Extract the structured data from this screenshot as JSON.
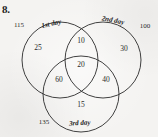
{
  "problem": {
    "number": "8."
  },
  "diagram": {
    "type": "venn-3-circle",
    "circles": [
      {
        "id": "first-day",
        "label": "1st day",
        "outside_total": "115"
      },
      {
        "id": "second-day",
        "label": "2nd day",
        "outside_total": "100"
      },
      {
        "id": "third-day",
        "label": "3rd day",
        "outside_total": "135"
      }
    ],
    "regions": [
      {
        "id": "first-only",
        "value": "25"
      },
      {
        "id": "first-second",
        "value": "10"
      },
      {
        "id": "second-only",
        "value": "30"
      },
      {
        "id": "first-third",
        "value": "60"
      },
      {
        "id": "all-three",
        "value": "20"
      },
      {
        "id": "second-third",
        "value": "40"
      },
      {
        "id": "third-only",
        "value": "15"
      }
    ],
    "style": {
      "stroke": "#2b2b2b",
      "background": "#f4f3f1"
    }
  }
}
